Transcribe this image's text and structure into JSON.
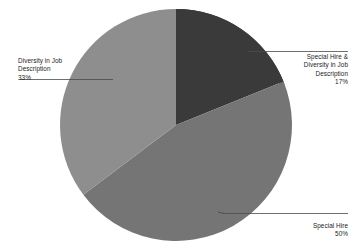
{
  "chart_data": {
    "type": "pie",
    "title": "",
    "labels": [
      "Special Hire & Diversity in Job Description",
      "Special Hire",
      "Diversity in Job Description"
    ],
    "values": [
      17,
      50,
      33
    ],
    "value_suffix": "%",
    "colors": [
      "#3a3a3a",
      "#757575",
      "#8e8e8e"
    ],
    "legend": "none",
    "grid": false,
    "start_angle_deg": 0,
    "direction": "clockwise",
    "slices": [
      {
        "name": "special-hire-and-diversity",
        "label": "Special Hire &\nDiversity in Job\nDescription",
        "percent": "17%",
        "value": 17,
        "color": "#3a3a3a",
        "start_deg": 0,
        "end_deg": 68
      },
      {
        "name": "special-hire",
        "label": "Special Hire",
        "percent": "50%",
        "value": 50,
        "color": "#757575",
        "start_deg": 68,
        "end_deg": 233
      },
      {
        "name": "diversity-in-job-description",
        "label": "Diversity in Job\nDescription",
        "percent": "33%",
        "value": 33,
        "color": "#8e8e8e",
        "start_deg": 233,
        "end_deg": 360
      }
    ]
  },
  "callouts": {
    "left": {
      "label": "Diversity in Job\nDescription",
      "percent": "33%"
    },
    "right_top": {
      "label": "Special Hire &\nDiversity in Job\nDescription",
      "percent": "17%"
    },
    "right_bottom": {
      "label": "Special Hire",
      "percent": "50%"
    }
  },
  "colors": {
    "slice_dark": "#3a3a3a",
    "slice_medium": "#757575",
    "slice_light": "#8e8e8e",
    "rim_shadow": "#1b1b1b",
    "leader_line": "#4a4a4a",
    "text": "#1d1d1d",
    "background": "#ffffff"
  }
}
